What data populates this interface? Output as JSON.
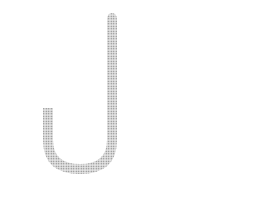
{
  "figure": {
    "panels": [
      {
        "id": "a",
        "caption": "(a)",
        "gas_box": {
          "line1_main": "P",
          "line1_sub": "gas",
          "eq": "=",
          "line2_main": "P",
          "line2_sub": "Hg"
        },
        "height_label": {
          "main": "P",
          "sub": "Hg"
        },
        "fluid_label": "Hg"
      },
      {
        "id": "b",
        "caption": "(b)",
        "gas_box": {
          "line1_main": "P",
          "line1_sub": "gas",
          "eq": "=",
          "line2_main": "P",
          "line2_sub": "Hg"
        },
        "height_label": {
          "main": "P",
          "sub": "Hg"
        },
        "fluid_label": "Hg",
        "vacuum_label": "P = 0"
      }
    ],
    "equation": {
      "lhs_main": "P",
      "lhs_sub": "gas",
      "eq": " = ",
      "rhs_main": "P",
      "rhs_sub": "Hg"
    },
    "colors": {
      "stroke": "#1a1a1a",
      "mercury_fill": "#c8c8c8",
      "dash": "#333333"
    }
  }
}
